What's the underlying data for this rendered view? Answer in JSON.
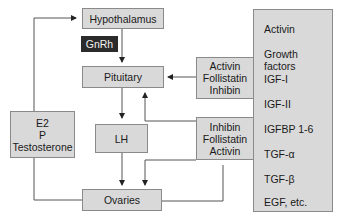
{
  "diagram": {
    "nodes": {
      "hypothalamus": "Hypothalamus",
      "gnrh": "GnRh",
      "pituitary": "Pituitary",
      "lh": "LH",
      "ovaries": "Ovaries",
      "steroids": [
        "E2",
        "P",
        "Testosterone"
      ],
      "pituitary_regulators": [
        "Activin",
        "Follistatin",
        "Inhibin"
      ],
      "ovarian_regulators": [
        "Inhibin",
        "Follistatin",
        "Activin"
      ]
    },
    "factor_list": [
      "Activin",
      "Growth factors",
      "IGF-I",
      "IGF-II",
      "IGFBP 1-6",
      "TGF-α",
      "TGF-β",
      "EGF, etc."
    ],
    "colors": {
      "box_fill": "#d9d9d9",
      "box_border": "#8a8a8a",
      "dark_label": "#2b2b2b",
      "line": "#555555"
    }
  }
}
